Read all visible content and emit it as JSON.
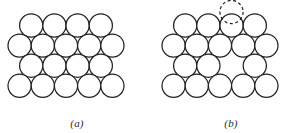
{
  "figure": {
    "background_color": "#ffffff",
    "circle_stroke_color": "#231f20",
    "circle_fill_color": "#ffffff",
    "caption_color": "#2b2b2b",
    "panels": [
      {
        "id": "a",
        "caption": "(a)",
        "description": "Perfect close-packed lattice of atoms, no defects",
        "origin_x": 0,
        "atom_radius": 11.6,
        "rows": [
          {
            "row_index": 0,
            "label": "row-1",
            "center_y": 25.5,
            "offset_x": 19.6,
            "count": 4,
            "spacing": 23.2,
            "vacancy_indices": []
          },
          {
            "row_index": 1,
            "label": "row-2",
            "center_y": 45.6,
            "offset_x": 8.0,
            "count": 5,
            "spacing": 23.2,
            "vacancy_indices": []
          },
          {
            "row_index": 2,
            "label": "row-3",
            "center_y": 65.7,
            "offset_x": 19.6,
            "count": 4,
            "spacing": 23.2,
            "vacancy_indices": []
          },
          {
            "row_index": 3,
            "label": "row-4",
            "center_y": 85.8,
            "offset_x": 8.0,
            "count": 5,
            "spacing": 23.2,
            "vacancy_indices": []
          }
        ],
        "ghost_atom": null
      },
      {
        "id": "b",
        "caption": "(b)",
        "description": "Lattice with a vacancy in the third row; displaced atom shown dashed above the surface",
        "origin_x": 154,
        "atom_radius": 11.6,
        "rows": [
          {
            "row_index": 0,
            "label": "row-1",
            "center_y": 25.5,
            "offset_x": 19.6,
            "count": 4,
            "spacing": 23.2,
            "vacancy_indices": []
          },
          {
            "row_index": 1,
            "label": "row-2",
            "center_y": 45.6,
            "offset_x": 8.0,
            "count": 5,
            "spacing": 23.2,
            "vacancy_indices": []
          },
          {
            "row_index": 2,
            "label": "row-3",
            "center_y": 65.7,
            "offset_x": 19.6,
            "count": 4,
            "spacing": 23.2,
            "vacancy_indices": [
              2
            ]
          },
          {
            "row_index": 3,
            "label": "row-4",
            "center_y": 85.8,
            "offset_x": 8.0,
            "count": 5,
            "spacing": 23.2,
            "vacancy_indices": []
          }
        ],
        "ghost_atom": {
          "label": "displaced-atom",
          "center_x": 77.5,
          "center_y": 12.0,
          "radius": 11.6,
          "stroke_dash": "3,2.6",
          "stroke_color": "#231f20"
        }
      }
    ]
  }
}
